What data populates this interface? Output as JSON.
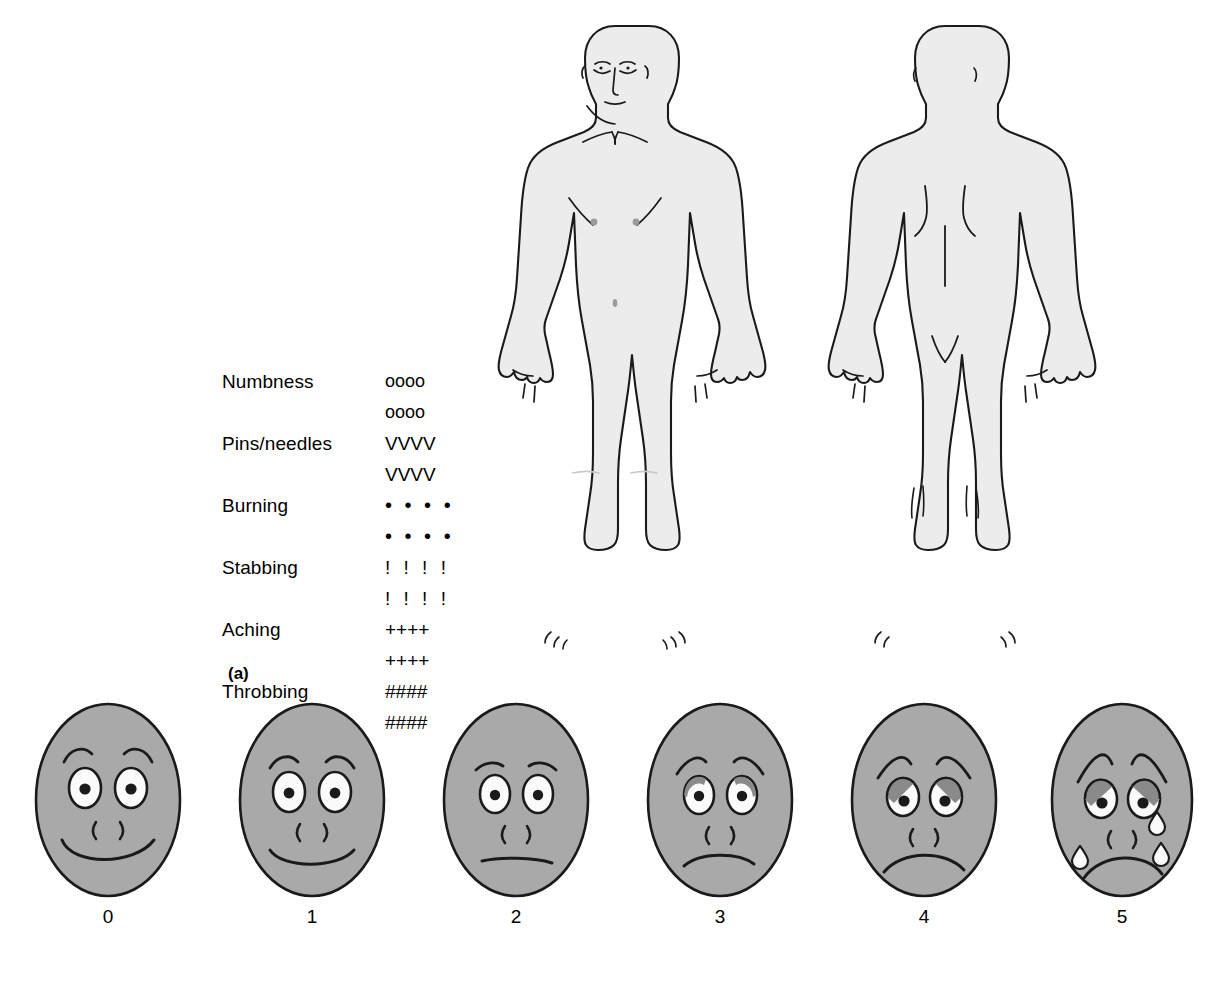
{
  "figure": {
    "panel_a_tag": "(a)",
    "panel_b_tag": "(b)"
  },
  "body_chart": {
    "views": [
      {
        "name": "front",
        "label": "front view of human body outline"
      },
      {
        "name": "back",
        "label": "back view of human body outline"
      }
    ]
  },
  "symbol_legend": {
    "rows": [
      {
        "label": "Numbness",
        "symbols_line1": "oooo",
        "symbols_line2": "oooo"
      },
      {
        "label": "Pins/needles",
        "symbols_line1": "VVVV",
        "symbols_line2": "VVVV"
      },
      {
        "label": "Burning",
        "symbols_line1": "• • • •",
        "symbols_line2": "• • • •"
      },
      {
        "label": "Stabbing",
        "symbols_line1": "! ! ! !",
        "symbols_line2": "! ! ! !"
      },
      {
        "label": "Aching",
        "symbols_line1": "++++",
        "symbols_line2": "++++"
      },
      {
        "label": "Throbbing",
        "symbols_line1": "####",
        "symbols_line2": "####"
      }
    ]
  },
  "faces_scale": {
    "faces": [
      {
        "number": "0",
        "expression": "broad smile, raised arched eyebrows"
      },
      {
        "number": "1",
        "expression": "slight smile, relaxed eyebrows"
      },
      {
        "number": "2",
        "expression": "neutral straight mouth, flat eyebrows"
      },
      {
        "number": "3",
        "expression": "slight frown, sloping eyebrows"
      },
      {
        "number": "4",
        "expression": "frown, worried eyebrows, heavy upper eyelids"
      },
      {
        "number": "5",
        "expression": "deep frown, crying with tears"
      }
    ]
  },
  "colors": {
    "body_fill": "#ececec",
    "face_fill": "#a9a9a9",
    "outline": "#1a1a1a",
    "eye_white": "#fbfbfb",
    "eyelid_shadow": "#8a8a8a",
    "page_background": "#ffffff"
  }
}
